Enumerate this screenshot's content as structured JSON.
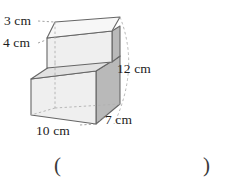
{
  "figure": {
    "type": "step-solid-isometric",
    "colors": {
      "outline": "#666666",
      "hidden_edge": "#b0b0b0",
      "top_face": "#f7f7f7",
      "front_face": "#efefef",
      "side_face": "#b9b9b9",
      "step_top_face": "#e2e2e2",
      "background": "#ffffff",
      "text": "#1c1c1c"
    },
    "labels": {
      "top_width": "3 cm",
      "upper_height": "4 cm",
      "total_height": "12 cm",
      "base_width": "10 cm",
      "depth": "7 cm"
    }
  },
  "answer": {
    "paren_open": "(",
    "paren_close": ")",
    "value": ""
  }
}
